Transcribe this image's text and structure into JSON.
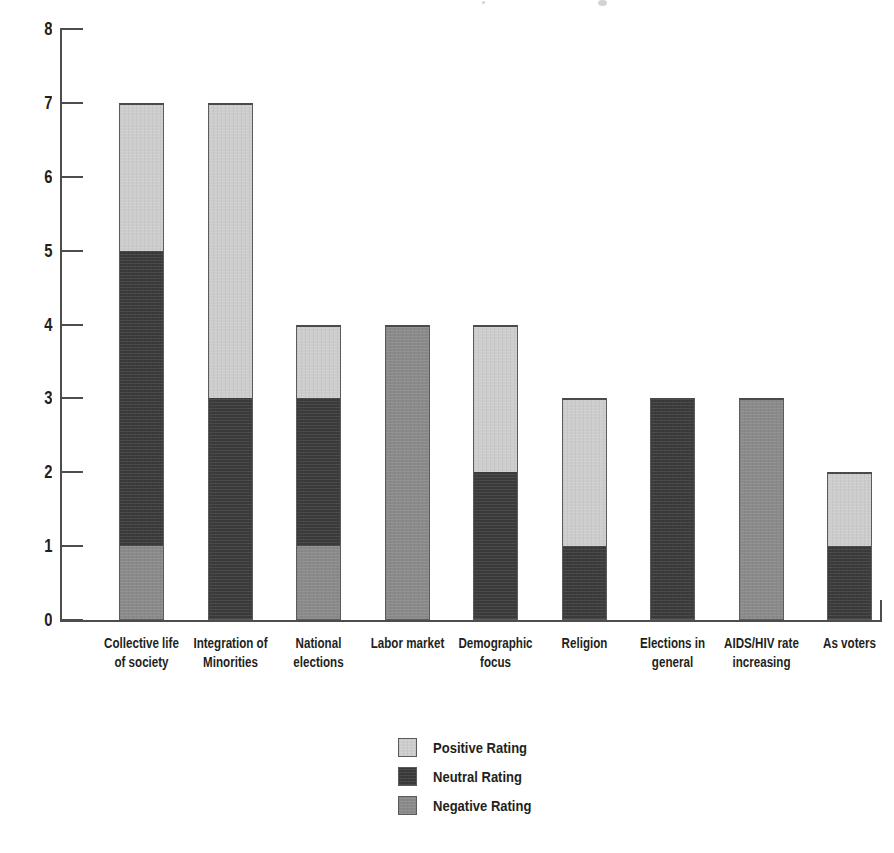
{
  "chart_data": {
    "type": "bar",
    "subtype": "stacked-vertical",
    "title": "",
    "subtitle": "",
    "xlabel": "",
    "ylabel": "",
    "ylim": [
      0,
      8
    ],
    "ytick_labels": [
      "8",
      "7",
      "6",
      "5",
      "4",
      "3",
      "2",
      "1",
      "0"
    ],
    "ytick_values": [
      8,
      7,
      6,
      5,
      4,
      3,
      2,
      1,
      0
    ],
    "grid": false,
    "legend_position": "bottom-center",
    "categories": [
      "Collective life of society",
      "Integration of Minorities",
      "National elections",
      "Labor market",
      "Demographic focus",
      "Religion",
      "Elections in general",
      "AIDS/HIV rate increasing",
      "As voters"
    ],
    "category_lines": [
      [
        "Collective life",
        "of society"
      ],
      [
        "Integration of",
        "Minorities"
      ],
      [
        "National",
        "elections"
      ],
      [
        "Labor market",
        ""
      ],
      [
        "Demographic",
        "focus"
      ],
      [
        "Religion",
        ""
      ],
      [
        "Elections in",
        "general"
      ],
      [
        "AIDS/HIV rate",
        "increasing"
      ],
      [
        "As voters",
        ""
      ]
    ],
    "series": [
      {
        "name": "Negative Rating",
        "color": "#8a8a8a",
        "values": [
          1,
          0,
          1,
          4,
          0,
          0,
          0,
          3,
          0
        ]
      },
      {
        "name": "Neutral Rating",
        "color": "#3b3b3b",
        "values": [
          4,
          3,
          2,
          0,
          2,
          1,
          3,
          0,
          1
        ]
      },
      {
        "name": "Positive Rating",
        "color": "#cdcdcd",
        "values": [
          2,
          4,
          1,
          0,
          2,
          2,
          0,
          0,
          1
        ]
      }
    ],
    "totals": [
      7,
      7,
      4,
      4,
      4,
      3,
      3,
      3,
      2
    ],
    "stack_order_bottom_to_top": [
      "Negative Rating",
      "Neutral Rating",
      "Positive Rating"
    ]
  },
  "legend": {
    "items": [
      {
        "label": "Positive Rating",
        "color": "#cdcdcd",
        "swatch": "positive-swatch"
      },
      {
        "label": "Neutral Rating",
        "color": "#3b3b3b",
        "swatch": "neutral-swatch"
      },
      {
        "label": "Negative Rating",
        "color": "#8a8a8a",
        "swatch": "negative-swatch"
      }
    ]
  },
  "axes": {
    "y": {
      "ticks": [
        {
          "label": "8",
          "value": 8
        },
        {
          "label": "7",
          "value": 7
        },
        {
          "label": "6",
          "value": 6
        },
        {
          "label": "5",
          "value": 5
        },
        {
          "label": "4",
          "value": 4
        },
        {
          "label": "3",
          "value": 3
        },
        {
          "label": "2",
          "value": 2
        },
        {
          "label": "1",
          "value": 1
        },
        {
          "label": "0",
          "value": 0
        }
      ]
    }
  }
}
